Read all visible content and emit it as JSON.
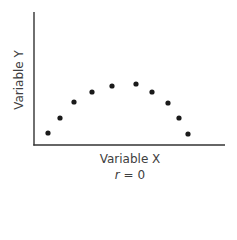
{
  "chart_data": {
    "type": "scatter",
    "title": "",
    "xlabel": "Variable X",
    "ylabel": "Variable Y",
    "annotation": "r = 0",
    "grid": false,
    "legend": null,
    "axis_ticks": "none",
    "x": [
      1,
      2,
      3,
      4,
      5,
      6,
      7,
      8,
      9,
      10
    ],
    "y": [
      1.0,
      2.6,
      4.3,
      5.4,
      6.0,
      6.2,
      5.4,
      4.2,
      2.6,
      0.9
    ],
    "point_color": "#1a1a1a",
    "axis_color": "#333333",
    "pixel_points": [
      [
        48,
        133
      ],
      [
        60,
        118
      ],
      [
        74,
        102
      ],
      [
        92,
        92
      ],
      [
        112,
        86
      ],
      [
        136,
        84
      ],
      [
        152,
        92
      ],
      [
        168,
        103
      ],
      [
        179,
        118
      ],
      [
        188,
        134
      ]
    ]
  },
  "labels": {
    "x_axis": "Variable X",
    "y_axis": "Variable Y",
    "r_symbol": "r",
    "r_eq": " = 0"
  }
}
